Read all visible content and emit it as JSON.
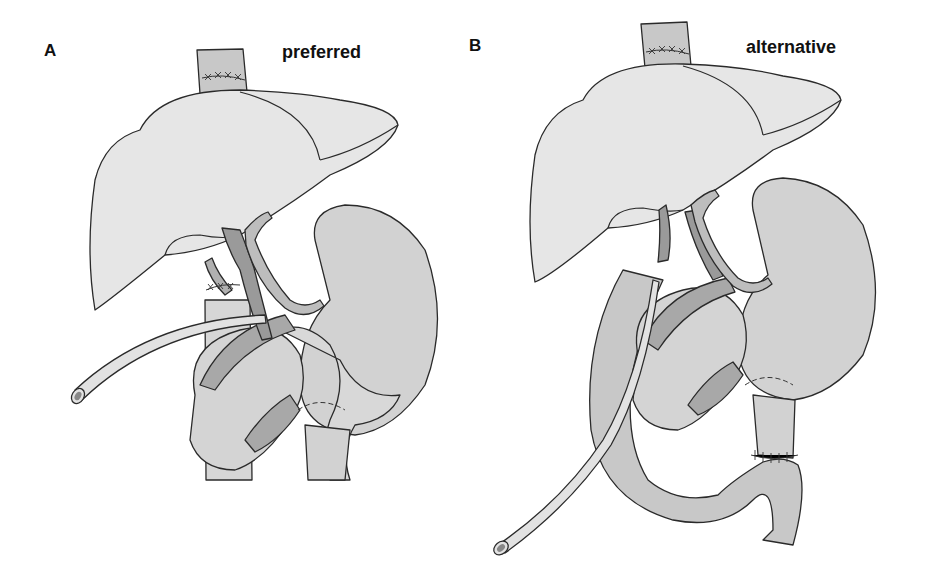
{
  "figure": {
    "panels": [
      {
        "letter": "A",
        "title": "preferred",
        "structures": [
          "esophagus",
          "liver",
          "gallbladder-fossa",
          "bile-duct",
          "hepatic-artery",
          "portal-vein",
          "stomach",
          "pancreas",
          "duodenum",
          "drainage-tube",
          "anastomosis-sutures"
        ]
      },
      {
        "letter": "B",
        "title": "alternative",
        "structures": [
          "esophagus",
          "liver",
          "bile-duct",
          "hepatic-artery",
          "portal-vein",
          "stomach",
          "pancreas",
          "duodenum",
          "roux-en-y-jejunal-limb",
          "stent-tube",
          "anastomosis-sutures"
        ]
      }
    ]
  },
  "colors": {
    "liver": "#e6e6e6",
    "organ_light": "#dcdcdc",
    "organ_mid": "#c9c9c9",
    "vessel_dark": "#9a9a9a",
    "vessel_mid": "#b5b5b5",
    "outline": "#2a2a2a"
  }
}
